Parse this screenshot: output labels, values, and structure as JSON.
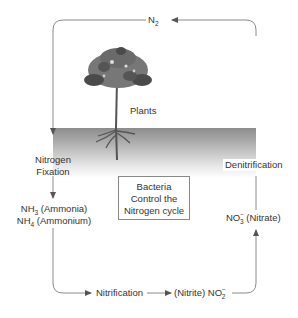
{
  "title": "Nitrogen Cycle",
  "colors": {
    "line": "#8a8a8a",
    "text": "#333333",
    "soil_top": "#8c8c8c",
    "soil_bottom": "#ffffff",
    "tree_canopy": "#6e6e6e",
    "tree_canopy_dark": "#444444"
  },
  "labels": {
    "n2": {
      "main": "N",
      "sub": "2"
    },
    "plants": "Plants",
    "nitrogen_fixation": [
      "Nitrogen",
      "Fixation"
    ],
    "ammonia": {
      "formula": "NH",
      "sub": "3",
      "name": "(Ammonia)"
    },
    "ammonium": {
      "formula": "NH",
      "sub": "4",
      "name": "(Ammonium)"
    },
    "bacteria_box": [
      "Bacteria",
      "Control the",
      "Nitrogen cycle"
    ],
    "denitrification": "Denitrification",
    "nitrate": {
      "formula": "NO",
      "sub": "3",
      "sup": "−",
      "name": "(Nitrate)"
    },
    "nitrification": "Nitrification",
    "nitrite": {
      "name": "(Nitrite)",
      "formula": "NO",
      "sub": "2",
      "sup": "−"
    }
  },
  "cycle_steps": [
    "N2",
    "Nitrogen Fixation",
    "NH3 (Ammonia) / NH4 (Ammonium)",
    "Nitrification",
    "(Nitrite) NO2-",
    "NO3- (Nitrate)",
    "Denitrification"
  ]
}
